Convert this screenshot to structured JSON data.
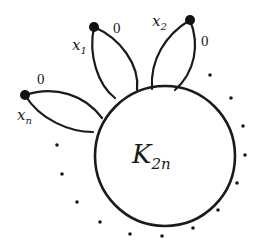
{
  "diagram": {
    "type": "graph-illustration",
    "central_node": {
      "label_main": "K",
      "label_sub": "2n",
      "shape": "circle"
    },
    "petals": [
      {
        "vertex_label": "x",
        "vertex_sub": "1",
        "edge_weight": "0"
      },
      {
        "vertex_label": "x",
        "vertex_sub": "2",
        "edge_weight": "0"
      },
      {
        "vertex_label": "x",
        "vertex_sub": "n",
        "edge_weight": "0"
      }
    ],
    "ellipsis": "dotted arc indicating further petals",
    "colors": {
      "ink": "#1a1a1a",
      "background": "#ffffff"
    }
  }
}
